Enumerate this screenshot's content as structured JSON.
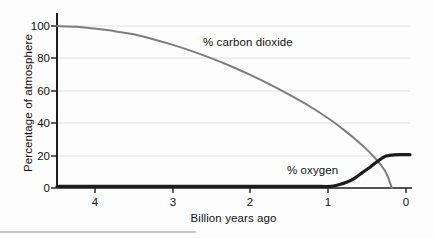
{
  "chart_data": {
    "type": "line",
    "title": "",
    "subtitle": "",
    "xlabel": "Billion years ago",
    "ylabel": "Percentage of atmosphere",
    "xlim": [
      4.45,
      0
    ],
    "ylim": [
      0,
      100
    ],
    "x_ticks": [
      4,
      3,
      2,
      1,
      0
    ],
    "x_tick_labels": [
      "4",
      "3",
      "2",
      "1",
      "0"
    ],
    "y_ticks": [
      0,
      20,
      40,
      60,
      80,
      100
    ],
    "y_tick_labels": [
      "0",
      "20",
      "40",
      "60",
      "80",
      "100"
    ],
    "grid": "horizontal",
    "legend_position": "inline-annotations",
    "x_axis_direction": "descending",
    "series": [
      {
        "name": "% carbon dioxide",
        "color": "#7d7d7d",
        "line_width": 2.0,
        "x": [
          4.45,
          4.2,
          4.0,
          3.75,
          3.5,
          3.25,
          3.0,
          2.75,
          2.5,
          2.25,
          2.0,
          1.75,
          1.5,
          1.25,
          1.0,
          0.85,
          0.7,
          0.55,
          0.45,
          0.38,
          0.32,
          0.28,
          0.25,
          0.23
        ],
        "values": [
          100,
          99.5,
          98.5,
          97,
          95,
          92,
          88.5,
          84.5,
          80,
          75,
          69.5,
          63.5,
          57,
          50,
          42,
          36.5,
          30.5,
          24,
          19,
          15,
          11,
          7,
          3,
          0
        ]
      },
      {
        "name": "% oxygen",
        "color": "#1c1c1c",
        "line_width": 3.2,
        "x": [
          4.45,
          4.0,
          3.5,
          3.0,
          2.5,
          2.0,
          1.5,
          1.2,
          1.0,
          0.9,
          0.8,
          0.7,
          0.6,
          0.5,
          0.42,
          0.35,
          0.3,
          0.2,
          0.1,
          0
        ],
        "values": [
          1,
          1,
          1,
          1,
          1,
          1,
          1,
          1,
          1,
          2,
          3.5,
          6,
          9.5,
          13,
          16,
          18.5,
          19.8,
          20.5,
          20.6,
          20.6
        ]
      }
    ],
    "annotations": [
      {
        "text": "% carbon dioxide",
        "x": 1.82,
        "y": 90
      },
      {
        "text": "% oxygen",
        "x": 0.7,
        "y": 14
      }
    ]
  },
  "colors": {
    "background": "#fdfdfd",
    "axis": "#1c1c1c",
    "gridline": "#e2e2e2",
    "text": "#111111",
    "carbon_dioxide": "#7d7d7d",
    "oxygen": "#1c1c1c",
    "page_rule": "#c9c9c9"
  }
}
